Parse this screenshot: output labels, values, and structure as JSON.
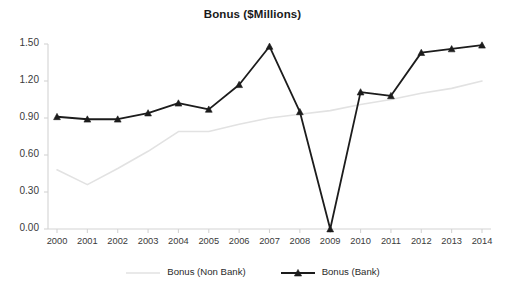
{
  "chart_data": {
    "type": "line",
    "title": "Bonus ($Millions)",
    "xlabel": "",
    "ylabel": "",
    "x": [
      "2000",
      "2001",
      "2002",
      "2003",
      "2004",
      "2005",
      "2006",
      "2007",
      "2008",
      "2009",
      "2010",
      "2011",
      "2012",
      "2013",
      "2014"
    ],
    "categories": [
      "2000",
      "2001",
      "2002",
      "2003",
      "2004",
      "2005",
      "2006",
      "2007",
      "2008",
      "2009",
      "2010",
      "2011",
      "2012",
      "2013",
      "2014"
    ],
    "series": [
      {
        "name": "Bonus (Non Bank)",
        "color": "#e2e2e2",
        "marker": "none",
        "values": [
          0.48,
          0.36,
          0.49,
          0.63,
          0.79,
          0.79,
          0.85,
          0.9,
          0.93,
          0.96,
          1.01,
          1.05,
          1.1,
          1.14,
          1.2
        ]
      },
      {
        "name": "Bonus (Bank)",
        "color": "#1c1c1c",
        "marker": "triangle",
        "values": [
          0.91,
          0.89,
          0.89,
          0.94,
          1.02,
          0.97,
          1.17,
          1.48,
          0.95,
          0.0,
          1.11,
          1.08,
          1.43,
          1.46,
          1.49
        ]
      }
    ],
    "ylim": [
      0.0,
      1.5
    ],
    "yticks": [
      0.0,
      0.3,
      0.6,
      0.9,
      1.2,
      1.5
    ],
    "ytick_labels": [
      "0.00",
      "0.30",
      "0.60",
      "0.90",
      "1.20",
      "1.50"
    ],
    "grid": false,
    "legend_position": "bottom"
  },
  "axis": {
    "y_labels": [
      "1.50",
      "1.20",
      "0.90",
      "0.60",
      "0.30",
      "0.00"
    ],
    "x_labels": [
      "2000",
      "2001",
      "2002",
      "2003",
      "2004",
      "2005",
      "2006",
      "2007",
      "2008",
      "2009",
      "2010",
      "2011",
      "2012",
      "2013",
      "2014"
    ]
  },
  "legend": {
    "items": [
      {
        "label": "Bonus (Non Bank)"
      },
      {
        "label": "Bonus (Bank)"
      }
    ]
  },
  "colors": {
    "bank_line": "#1c1c1c",
    "non_bank_line": "#e2e2e2",
    "axis": "#d4d4d4",
    "text": "#3a3a3a",
    "background": "#ffffff"
  }
}
